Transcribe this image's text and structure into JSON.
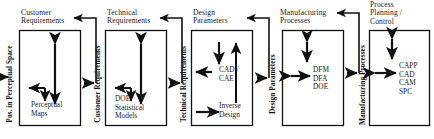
{
  "diagram": {
    "type": "process-flow",
    "background_color": "#ffffff",
    "line_color": "#111111",
    "stages": [
      {
        "id": "customer-requirements",
        "title": "Customer\nRequirements",
        "content": "Perceptual\nMaps",
        "input_label": "Pos. in Perceptual Space",
        "internal_arrows": [
          "double-vertical",
          "elbow-left-out",
          "short-down"
        ]
      },
      {
        "id": "technical-requirements",
        "title": "Technical\nRequirements",
        "content": "DOE\nStatistical\nModels",
        "input_label": "Customer Requirements",
        "internal_arrows": [
          "double-vertical",
          "elbow-left-out",
          "short-down"
        ]
      },
      {
        "id": "design-parameters",
        "title": "Design\nParameters",
        "content": "CAD /\nCAE",
        "content2": "Inverse\nDesign",
        "input_label": "Technical Requirements",
        "internal_arrows": [
          "down-into-cad",
          "left-out-cad",
          "up-from-inverse",
          "right-into-inverse"
        ]
      },
      {
        "id": "manufacturing-processes",
        "title": "Manufacturing\nProcesses",
        "content": "DFM\nDFA\nDOE",
        "input_label": "Design Parameters",
        "internal_arrows": [
          "double-vertical-short",
          "double-horizontal"
        ]
      },
      {
        "id": "process-planning-control",
        "title": "Process\nPlanning /\nControl",
        "content": "CAPP\nCAD\nCAM\nSPC",
        "input_label": "Manufacturing Processes",
        "internal_arrows": [
          "double-vertical-short",
          "double-horizontal"
        ]
      }
    ],
    "feedback_arrows": [
      {
        "from": "technical-requirements",
        "to": "customer-requirements"
      },
      {
        "from": "design-parameters",
        "to": "technical-requirements"
      },
      {
        "from": "manufacturing-processes",
        "to": "design-parameters"
      },
      {
        "from": "process-planning-control",
        "to": "manufacturing-processes"
      }
    ]
  }
}
